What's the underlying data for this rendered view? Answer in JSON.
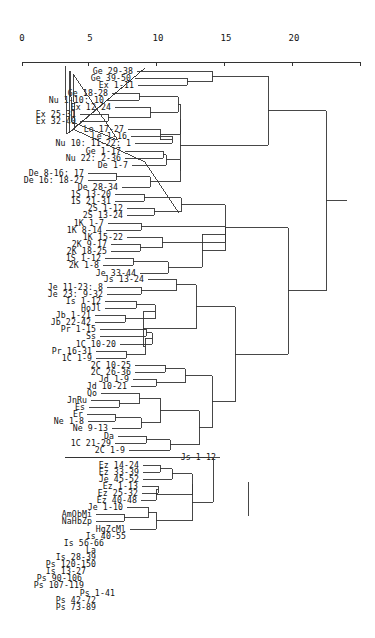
{
  "chart_data": {
    "type": "dendrogram",
    "title": "",
    "xlabel": "",
    "ylabel": "",
    "orientation": "horizontal",
    "axis": {
      "ticks": [
        0,
        5,
        10,
        15,
        20
      ],
      "tick_labels": [
        "0",
        "5",
        "10",
        "15",
        "20"
      ],
      "range": [
        0,
        25
      ]
    },
    "leaves": [
      "Ge 29-38",
      "Ge 39-50",
      "Ex 1-11",
      "Ge 18-28",
      "Nu 1-10: 10",
      "Ex 12-24",
      "Ex 25-31",
      "Ex 32-40",
      "Le 17-27",
      "Le 1-16",
      "Nu 10: 11-22: 1",
      "Ge 1-17",
      "Nu 22: 2-36",
      "De 1-7",
      "De 8-16: 17",
      "De 16: 18-27",
      "De 28-34",
      "1S 13-20",
      "1S 21-31",
      "2S 1-12",
      "2S 13-24",
      "1K 1-7",
      "1K 8-14",
      "1K 15-22",
      "2K 9-17",
      "2K 18-25",
      "1S 1-12",
      "2K 1-8",
      "Je 33-44",
      "Js 13-24",
      "Je 11-23: 8",
      "Je 23: 9-32",
      "Is 1-12",
      "HoJl",
      "Jb 1-21",
      "Jb 22-42",
      "Pr 1-15",
      "Ss",
      "1C 10-20",
      "Pr 16-31",
      "1C 1-9",
      "2C 10-25",
      "2C 26-36",
      "Jd 1-9",
      "Jd 10-21",
      "Qo",
      "JnRu",
      "Es",
      "Er",
      "Ne 1-8",
      "Ne 9-13",
      "Da",
      "1C 21-29",
      "2C 1-9",
      "Js 1-12",
      "Ez 14-24",
      "Ez 33-39",
      "Je 45-52",
      "Ez 1-13",
      "Ez 25-32",
      "Ez 40-48",
      "Je 1-10",
      "AmObMi",
      "NaHbZp",
      "HgZcMl",
      "Is 40-55",
      "Is 56-66",
      "La",
      "Is 28-39",
      "Ps 120-150",
      "Is 13-27",
      "Ps 90-106",
      "Ps 107-119",
      "Ps 1-41",
      "Ps 42-72",
      "Ps 73-89"
    ],
    "merges": [
      {
        "members": [
          "Ge 39-50",
          "Ex 1-11"
        ],
        "height": 11.2
      },
      {
        "members": [
          "Ge 29-38",
          "(Ge 39-50, Ex 1-11)"
        ],
        "height": 12.6
      },
      {
        "members": [
          "Ge 18-28",
          "Nu 1-10: 10"
        ],
        "height": 7.7
      },
      {
        "members": [
          "Ex 25-31",
          "Ex 32-40"
        ],
        "height": 6.1
      },
      {
        "members": [
          "Ex 12-24",
          "(Ex 25-31, Ex 32-40)"
        ],
        "height": 8.3
      },
      {
        "members": [
          "Le 1-16",
          "Nu 10: 11-22: 1"
        ],
        "height": 9.6
      },
      {
        "members": [
          "Ge 1-17",
          "Nu 22: 2-36"
        ],
        "height": 9.0
      },
      {
        "members": [
          "De 8-16: 17",
          "De 16: 18-27"
        ],
        "height": 6.5
      },
      {
        "members": [
          "1S 13-20",
          "1S 21-31"
        ],
        "height": 8.0
      },
      {
        "members": [
          "2S 1-12",
          "2S 13-24"
        ],
        "height": 8.7
      },
      {
        "members": [
          "1K 1-7",
          "1K 8-14"
        ],
        "height": 7.8
      },
      {
        "members": [
          "2K 9-17",
          "2K 18-25"
        ],
        "height": 7.7
      },
      {
        "members": [
          "1S 1-12",
          "2K 1-8"
        ],
        "height": 7.4
      },
      {
        "members": [
          "Je 11-23: 8",
          "Je 23: 9-32"
        ],
        "height": 7.8
      },
      {
        "members": [
          "Is 1-12",
          "HoJl"
        ],
        "height": 7.5
      },
      {
        "members": [
          "Jb 1-21",
          "Jb 22-42"
        ],
        "height": 6.9
      },
      {
        "members": [
          "Pr 1-15",
          "Ss"
        ],
        "height": 7.2
      },
      {
        "members": [
          "Pr 16-31",
          "1C 1-9"
        ],
        "height": 7.0
      },
      {
        "members": [
          "2C 10-25",
          "2C 26-36"
        ],
        "height": 9.1
      },
      {
        "members": [
          "Jd 1-9",
          "Jd 10-21"
        ],
        "height": 8.6
      },
      {
        "members": [
          "JnRu",
          "Es"
        ],
        "height": 6.6
      },
      {
        "members": [
          "Er",
          "Ne 1-8"
        ],
        "height": 6.4
      },
      {
        "members": [
          "Da",
          "1C 21-29"
        ],
        "height": 8.1
      },
      {
        "members": [
          "Ez 14-24",
          "Ez 33-39"
        ],
        "height": 9.5
      },
      {
        "members": [
          "Ez 1-13",
          "Ez 25-32"
        ],
        "height": 8.6
      },
      {
        "members": [
          "AmObMi",
          "NaHbZp"
        ],
        "height": 6.8
      },
      {
        "members": [
          "Is 56-66",
          "La"
        ],
        "height": 7.4
      },
      {
        "members": [
          "Is 28-39",
          "Ps 120-150"
        ],
        "height": 7.4
      },
      {
        "members": [
          "Ps 90-106",
          "Ps 107-119"
        ],
        "height": 6.8
      },
      {
        "members": [
          "Ps 42-72",
          "Ps 73-89"
        ],
        "height": 7.2
      },
      {
        "members": [
          "Pentateuch cluster",
          "History/Prophets cluster"
        ],
        "height": 23.2
      },
      {
        "members": [
          "All above",
          "Prophets/Psalms cluster"
        ],
        "height": 26.7
      }
    ],
    "grid": false,
    "legend": null
  }
}
